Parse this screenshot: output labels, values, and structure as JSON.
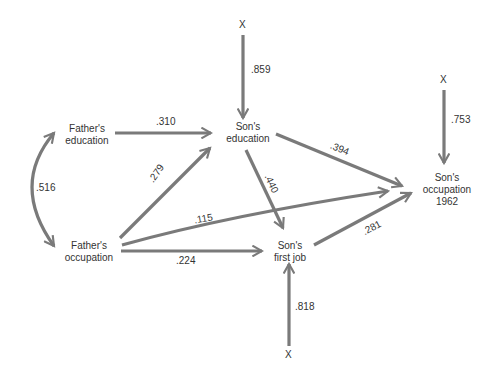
{
  "diagram": {
    "title": "",
    "colors": {
      "arrow": "#7a7a7a",
      "text": "#333333",
      "background": "#ffffff"
    },
    "nodes": {
      "fathers_education": {
        "line1": "Father's",
        "line2": "education"
      },
      "fathers_occupation": {
        "line1": "Father's",
        "line2": "occupation"
      },
      "sons_education": {
        "line1": "Son's",
        "line2": "education"
      },
      "sons_first_job": {
        "line1": "Son's",
        "line2": "first job"
      },
      "sons_occupation_1962": {
        "line1": "Son's",
        "line2": "occupation",
        "line3": "1962"
      }
    },
    "residuals": {
      "sons_education": {
        "label": "X",
        "coef": ".859"
      },
      "sons_occupation_1962": {
        "label": "X",
        "coef": ".753"
      },
      "sons_first_job": {
        "label": "X",
        "coef": ".818"
      }
    },
    "paths": {
      "fathers_education_to_sons_education": ".310",
      "fathers_occupation_to_sons_education": ".279",
      "fathers_occupation_to_sons_occupation": ".115",
      "fathers_occupation_to_sons_first_job": ".224",
      "sons_education_to_sons_occupation": ".394",
      "sons_education_to_sons_first_job": ".440",
      "sons_first_job_to_sons_occupation": ".281",
      "fathers_education_fathers_occupation_correlation": ".516"
    }
  }
}
